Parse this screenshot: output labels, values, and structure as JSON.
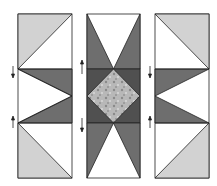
{
  "diagram": {
    "title": "",
    "type": "quilt-block-assembly",
    "colors": {
      "light": "#d2d2d2",
      "medium": "#6e6e6e",
      "dark": "#505050",
      "white": "#ffffff",
      "outline": "#222222",
      "center": "#b8b8b8"
    },
    "columns": [
      "left-column",
      "center-column",
      "right-column"
    ],
    "arrows": [
      {
        "column": "left",
        "position": "upper",
        "direction": "down"
      },
      {
        "column": "left",
        "position": "lower",
        "direction": "up"
      },
      {
        "column": "center",
        "position": "upper",
        "direction": "up"
      },
      {
        "column": "center",
        "position": "lower",
        "direction": "down"
      },
      {
        "column": "right",
        "position": "upper",
        "direction": "down"
      },
      {
        "column": "right",
        "position": "lower",
        "direction": "up"
      }
    ]
  }
}
